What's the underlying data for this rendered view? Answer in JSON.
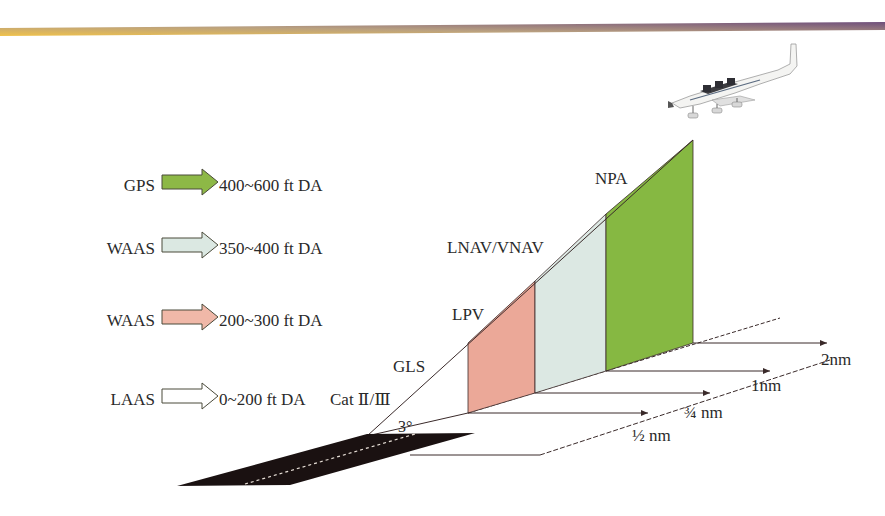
{
  "header": {
    "gradient_start": "#f0c24a",
    "gradient_mid": "#b9a080",
    "gradient_end": "#6f4f7c"
  },
  "legend": [
    {
      "system": "GPS",
      "range": "400~600 ft DA",
      "arrow_color": "#8db846",
      "suffix": ""
    },
    {
      "system": "WAAS",
      "range": "350~400 ft DA",
      "arrow_color": "#dbe8e2",
      "suffix": ""
    },
    {
      "system": "WAAS",
      "range": "200~300 ft DA",
      "arrow_color": "#f0b8a8",
      "suffix": ""
    },
    {
      "system": "LAAS",
      "range": "0~200 ft DA",
      "arrow_color": "#ffffff",
      "suffix": "Cat Ⅱ/Ⅲ"
    }
  ],
  "approach_labels": {
    "npa": "NPA",
    "lnav_vnav": "LNAV/VNAV",
    "lpv": "LPV",
    "gls": "GLS",
    "glide_angle": "3°"
  },
  "panels": {
    "lpv_color": "#eba898",
    "lnav_vnav_color": "#dce8e3",
    "npa_color": "#86b842"
  },
  "distances": {
    "half": "½ nm",
    "three_quarter": "¾ nm",
    "one": "1nm",
    "two": "2nm"
  },
  "runway": {
    "color": "#1a1111",
    "centerline_color": "#e8e0d8"
  }
}
